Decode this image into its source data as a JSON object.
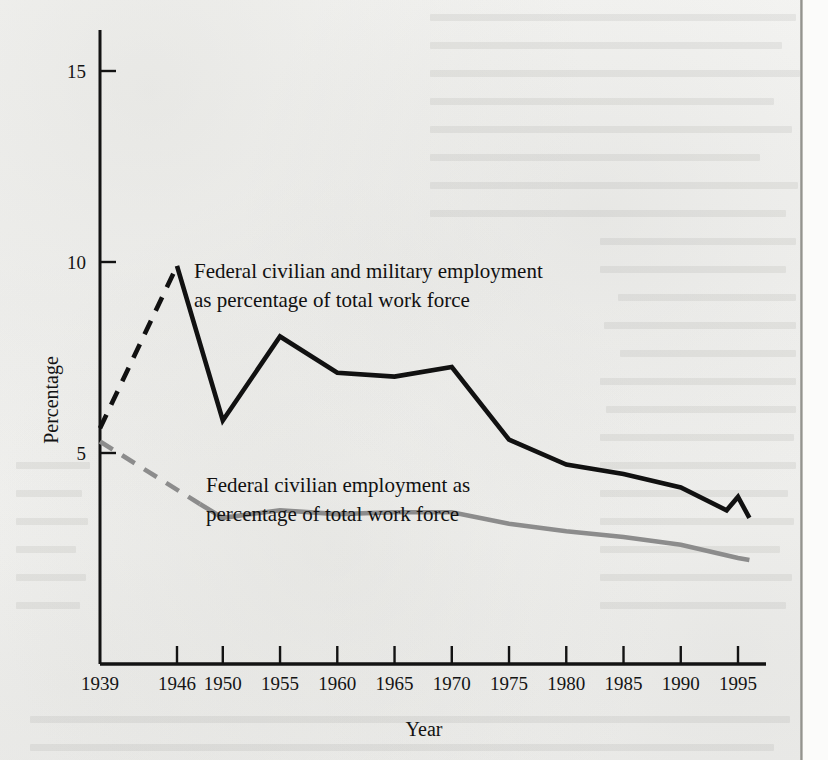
{
  "chart_data": {
    "type": "line",
    "title": "",
    "xlabel": "Year",
    "ylabel": "Percentage",
    "xlim": [
      1939,
      1997
    ],
    "ylim": [
      0,
      15.8
    ],
    "grid": false,
    "legend_position": "inline-annotations",
    "x_tick_labels": [
      "1939",
      "1946",
      "1950",
      "1955",
      "1960",
      "1965",
      "1970",
      "1975",
      "1980",
      "1985",
      "1990",
      "1995"
    ],
    "x_ticks": [
      1939,
      1946,
      1950,
      1955,
      1960,
      1965,
      1970,
      1975,
      1980,
      1985,
      1990,
      1995
    ],
    "y_tick_labels": [
      "5",
      "10",
      "15"
    ],
    "y_ticks": [
      5,
      10,
      15
    ],
    "series": [
      {
        "name": "Federal civilian and military employment as percentage of total work force",
        "color": "#111111",
        "width": 4.6,
        "x": [
          1939,
          1946,
          1950,
          1955,
          1960,
          1965,
          1970,
          1975,
          1980,
          1985,
          1990,
          1994,
          1995,
          1996
        ],
        "values": [
          5.65,
          9.9,
          5.85,
          8.05,
          7.1,
          7.0,
          7.25,
          5.35,
          4.7,
          4.45,
          4.1,
          3.5,
          3.85,
          3.3
        ],
        "dashed_until_x": 1946
      },
      {
        "name": "Federal civilian employment as percentage of total work force",
        "color": "#8c8c8c",
        "width": 4.6,
        "x": [
          1939,
          1950,
          1955,
          1960,
          1965,
          1970,
          1975,
          1980,
          1985,
          1990,
          1995,
          1996
        ],
        "values": [
          5.3,
          3.3,
          3.5,
          3.4,
          3.45,
          3.45,
          3.15,
          2.95,
          2.8,
          2.6,
          2.25,
          2.2
        ],
        "dashed_until_x": 1948
      }
    ],
    "annotations": [
      {
        "id": "annotation-military",
        "lines": [
          "Federal civilian and military employment",
          "as percentage of total work force"
        ],
        "x_px": 194,
        "y_px": 278
      },
      {
        "id": "annotation-civilian",
        "lines": [
          "Federal civilian employment as",
          "percentage of total work force"
        ],
        "x_px": 206,
        "y_px": 492
      }
    ]
  },
  "axes": {
    "y_title": "Percentage",
    "x_title": "Year"
  }
}
